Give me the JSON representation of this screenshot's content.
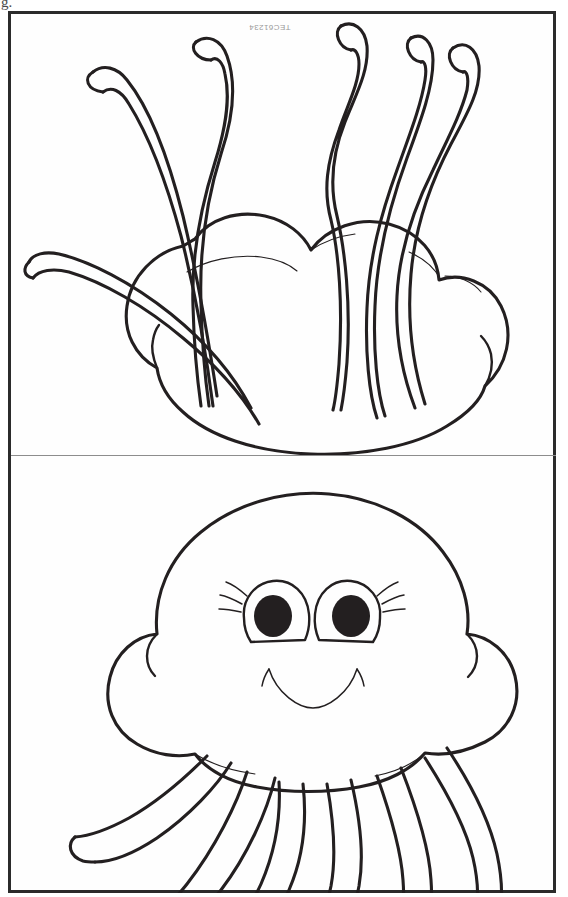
{
  "page": {
    "background_color": "#ffffff",
    "paper_color": "#fefefe",
    "ink_color": "#231f20",
    "frame_color": "#2b2b2b",
    "divider_color": "#8d8d8d",
    "width": 568,
    "height": 897
  },
  "scan_artifact": {
    "text": "g.",
    "description": "partial-glyph-cropped-at-top-left-edge"
  },
  "watermark": {
    "text": "TEC61234",
    "rotation_degrees": 180,
    "color": "#9a9a9a"
  },
  "panels": [
    {
      "id": "top-panel",
      "name": "jellyfish-back-view",
      "subject": "jellyfish",
      "view": "back",
      "tentacle_count": 6,
      "tentacle_direction": "up",
      "bell_lobes": 3,
      "has_face": false
    },
    {
      "id": "bottom-panel",
      "name": "jellyfish-front-view",
      "subject": "jellyfish",
      "view": "front",
      "tentacle_count": 6,
      "tentacle_direction": "down",
      "bell_lobes": 3,
      "has_face": true,
      "face": {
        "eyes": 2,
        "eyelashes_per_eye": 3,
        "pupil_color": "#231f20",
        "mouth": "smile"
      }
    }
  ]
}
